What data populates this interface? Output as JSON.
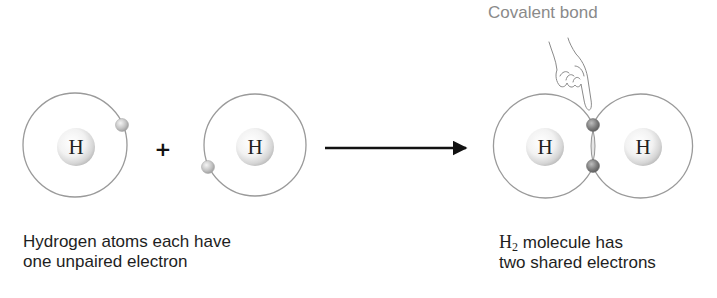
{
  "diagram": {
    "title_label": "Covalent bond",
    "reactants": {
      "atoms": [
        {
          "symbol": "H",
          "unpaired_electrons": 1
        },
        {
          "symbol": "H",
          "unpaired_electrons": 1
        }
      ],
      "operator": "+",
      "caption_line1": "Hydrogen atoms each have",
      "caption_line2": "one unpaired electron"
    },
    "product": {
      "atoms": [
        {
          "symbol": "H"
        },
        {
          "symbol": "H"
        }
      ],
      "shared_electrons": 2,
      "formula_symbol": "H",
      "formula_subscript": "2",
      "caption_line1_rest": " molecule has",
      "caption_line2": "two shared electrons"
    },
    "colors": {
      "orbit": "#9a9a9a",
      "electron_unpaired": "#b8b8b8",
      "electron_shared": "#7a7a7a",
      "arrow": "#111111",
      "label": "#8a8a8a"
    }
  }
}
